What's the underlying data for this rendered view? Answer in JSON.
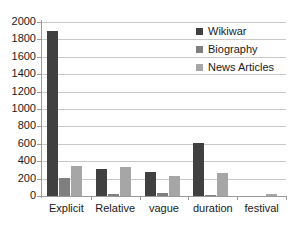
{
  "chart_data": {
    "type": "bar",
    "title": "",
    "xlabel": "",
    "ylabel": "",
    "ylim": [
      0,
      2000
    ],
    "ytick_step": 200,
    "yticks": [
      2000,
      1800,
      1600,
      1400,
      1200,
      1000,
      800,
      600,
      400,
      200,
      0
    ],
    "grid": true,
    "legend_position": "top-right",
    "categories": [
      "Explicit",
      "Relative",
      "vague",
      "duration",
      "festival"
    ],
    "series": [
      {
        "name": "Wikiwar",
        "color": "#404040",
        "values": [
          1900,
          305,
          275,
          605,
          0
        ]
      },
      {
        "name": "Biography",
        "color": "#7f7f7f",
        "values": [
          210,
          20,
          30,
          10,
          0
        ]
      },
      {
        "name": "News Articles",
        "color": "#a6a6a6",
        "values": [
          350,
          330,
          225,
          270,
          25
        ]
      }
    ]
  }
}
